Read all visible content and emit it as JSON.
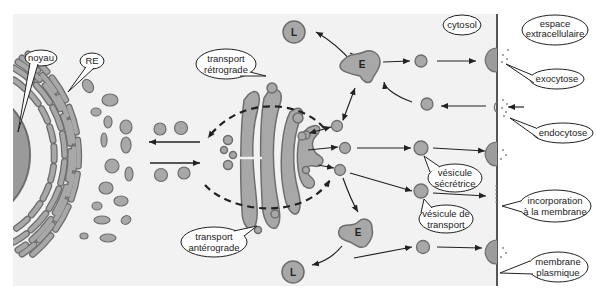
{
  "diagram": {
    "type": "cell-secretory-pathway",
    "colors": {
      "background": "#f2f2f2",
      "organelle_fill": "#a8a8a8",
      "organelle_stroke": "#6e6e6e",
      "nucleus_fill": "#9a9a9a",
      "arrow": "#222222",
      "membrane": "#555555"
    },
    "labels": {
      "noyau": "noyau",
      "re": "RE",
      "transport_retrograde_1": "transport",
      "transport_retrograde_2": "rétrograde",
      "transport_anterograde_1": "transport",
      "transport_anterograde_2": "antérograde",
      "cytosol": "cytosol",
      "espace_1": "espace",
      "espace_2": "extracellulaire",
      "exocytose": "exocytose",
      "endocytose": "endocytose",
      "vesicule_secretrice_1": "vésicule",
      "vesicule_secretrice_2": "sécrétrice",
      "vesicule_transport_1": "vésicule de",
      "vesicule_transport_2": "transport",
      "incorporation_1": "incorporation",
      "incorporation_2": "à la membrane",
      "membrane_1": "membrane",
      "membrane_2": "plasmique",
      "endosome_top": "E",
      "endosome_bottom": "E",
      "lysosome_top": "L",
      "lysosome_bottom": "L"
    }
  }
}
